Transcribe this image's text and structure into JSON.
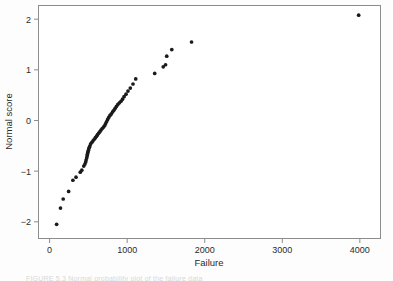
{
  "figure": {
    "background_color": "#fdfdfd",
    "plot_background_color": "#ffffff",
    "frame_color": "#8c8c8c",
    "point_color": "#1a1a1a",
    "text_color": "#2b2b2b",
    "caption_partial": "FIGURE 5.3  Normal probability plot of the failure data"
  },
  "chart_data": {
    "type": "scatter",
    "title": "",
    "subtitle": "",
    "xlabel": "Failure",
    "ylabel": "Normal score",
    "xlim": [
      -150,
      4260
    ],
    "ylim": [
      -2.32,
      2.28
    ],
    "xticks": [
      0,
      1000,
      2000,
      3000,
      4000
    ],
    "xtick_labels": [
      "0",
      "1000",
      "2000",
      "3000",
      "4000"
    ],
    "yticks": [
      -2,
      -1,
      0,
      1,
      2
    ],
    "ytick_labels": [
      "-2",
      "-1",
      "0",
      "1",
      "2"
    ],
    "grid": false,
    "legend": null,
    "marker": "filled-circle",
    "marker_size": 2.6,
    "series": [
      {
        "name": "Failure vs normal score",
        "x": [
          90,
          140,
          175,
          245,
          300,
          340,
          395,
          415,
          440,
          455,
          465,
          470,
          478,
          483,
          487,
          490,
          495,
          500,
          505,
          512,
          520,
          530,
          545,
          560,
          575,
          590,
          605,
          618,
          632,
          648,
          662,
          678,
          695,
          710,
          722,
          735,
          748,
          762,
          778,
          795,
          812,
          828,
          845,
          862,
          880,
          900,
          920,
          940,
          960,
          985,
          1010,
          1040,
          1075,
          1110,
          1355,
          1465,
          1495,
          1510,
          1575,
          1830,
          3985
        ],
        "y": [
          -2.05,
          -1.73,
          -1.55,
          -1.4,
          -1.18,
          -1.12,
          -1.02,
          -0.98,
          -0.9,
          -0.86,
          -0.82,
          -0.78,
          -0.74,
          -0.7,
          -0.67,
          -0.64,
          -0.62,
          -0.59,
          -0.56,
          -0.53,
          -0.5,
          -0.46,
          -0.43,
          -0.4,
          -0.37,
          -0.34,
          -0.31,
          -0.28,
          -0.25,
          -0.22,
          -0.19,
          -0.16,
          -0.13,
          -0.1,
          -0.06,
          -0.02,
          0.02,
          0.06,
          0.1,
          0.13,
          0.17,
          0.2,
          0.24,
          0.28,
          0.32,
          0.35,
          0.38,
          0.42,
          0.47,
          0.52,
          0.58,
          0.64,
          0.72,
          0.82,
          0.93,
          1.06,
          1.1,
          1.27,
          1.4,
          1.55,
          2.08
        ]
      }
    ]
  }
}
